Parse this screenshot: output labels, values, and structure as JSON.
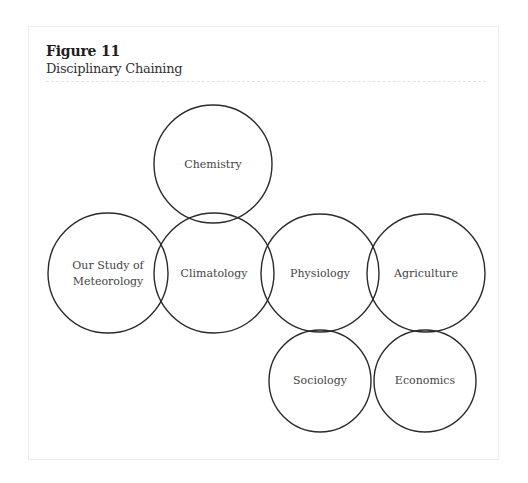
{
  "figure": {
    "label": "Figure 11",
    "caption": "Disciplinary Chaining"
  },
  "diagram": {
    "type": "overlapping-circles",
    "stroke_color": "#2b2b2b",
    "nodes": [
      {
        "id": "chemistry",
        "lines": [
          "Chemistry"
        ],
        "cx": 213,
        "cy": 164,
        "r": 59
      },
      {
        "id": "meteorology",
        "lines": [
          "Our Study of",
          "Meteorology"
        ],
        "cx": 108,
        "cy": 273,
        "r": 60
      },
      {
        "id": "climatology",
        "lines": [
          "Climatology"
        ],
        "cx": 214,
        "cy": 273,
        "r": 60
      },
      {
        "id": "physiology",
        "lines": [
          "Physiology"
        ],
        "cx": 320,
        "cy": 273,
        "r": 59
      },
      {
        "id": "agriculture",
        "lines": [
          "Agriculture"
        ],
        "cx": 426,
        "cy": 273,
        "r": 59
      },
      {
        "id": "sociology",
        "lines": [
          "Sociology"
        ],
        "cx": 320,
        "cy": 381,
        "r": 51
      },
      {
        "id": "economics",
        "lines": [
          "Economics"
        ],
        "cx": 425,
        "cy": 381,
        "r": 51
      }
    ]
  }
}
